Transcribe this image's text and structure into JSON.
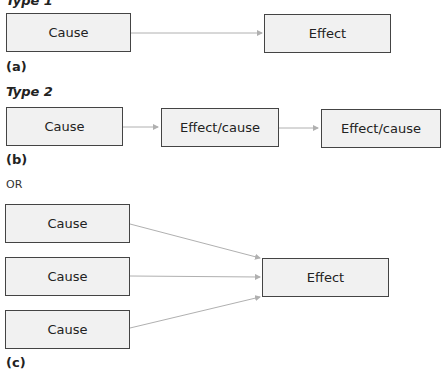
{
  "type1": {
    "heading": "Type 1",
    "cause": "Cause",
    "effect": "Effect",
    "caption": "(a)"
  },
  "type2": {
    "heading": "Type 2",
    "cause": "Cause",
    "effect_cause_1": "Effect/cause",
    "effect_cause_2": "Effect/cause",
    "caption": "(b)"
  },
  "or_label": "OR",
  "type3": {
    "causes": [
      "Cause",
      "Cause",
      "Cause"
    ],
    "effect": "Effect",
    "caption": "(c)"
  },
  "colors": {
    "box_fill": "#f1f1f1",
    "box_border": "#444444",
    "arrow": "#b0b0b0"
  }
}
